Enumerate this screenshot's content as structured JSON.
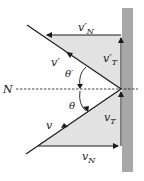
{
  "diagram": {
    "colors": {
      "wall": "#a8a8a8",
      "triangle_fill": "#e2e2e2",
      "line": "#1a1a1a",
      "background": "#ffffff"
    },
    "normal_label": "N",
    "incoming": {
      "velocity_label": "v",
      "angle_label": "θ",
      "tangential": {
        "base": "v",
        "sub": "T"
      },
      "normal": {
        "base": "v",
        "sub": "N"
      }
    },
    "reflected": {
      "velocity_label": "v′",
      "angle_label": "θ′",
      "tangential": {
        "base": "v′",
        "sub": "T"
      },
      "normal": {
        "base": "v′",
        "sub": "N"
      }
    }
  }
}
